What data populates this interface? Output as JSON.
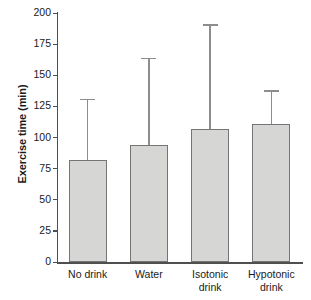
{
  "chart_data": {
    "type": "bar",
    "title": "",
    "xlabel": "",
    "ylabel": "Exercise time (min)",
    "categories": [
      "No drink",
      "Water",
      "Isotonic drink",
      "Hypotonic drink"
    ],
    "category_lines": [
      [
        "No drink"
      ],
      [
        "Water"
      ],
      [
        "Isotonic",
        "drink"
      ],
      [
        "Hypotonic",
        "drink"
      ]
    ],
    "values": [
      82,
      94,
      107,
      111
    ],
    "errors_upper": [
      131,
      164,
      191,
      138
    ],
    "error_type": "upper-only error bar (SD)",
    "ylim": [
      0,
      200
    ],
    "yticks": [
      0,
      25,
      50,
      75,
      100,
      125,
      150,
      175,
      200
    ],
    "ytick_labels": [
      "0",
      "25",
      "50",
      "75",
      "100",
      "125",
      "150",
      "175",
      "200"
    ],
    "grid": false,
    "legend": false,
    "series": [
      {
        "name": "Exercise time",
        "values": [
          82,
          94,
          107,
          111
        ],
        "errors_upper": [
          131,
          164,
          191,
          138
        ]
      }
    ],
    "colors": {
      "bar_fill": "#d6d6d4",
      "bar_border": "#757575",
      "error_bar": "#8d8d8d",
      "axis": "#4f4f4f",
      "text": "#1a1a1a",
      "background": "#ffffff"
    }
  }
}
